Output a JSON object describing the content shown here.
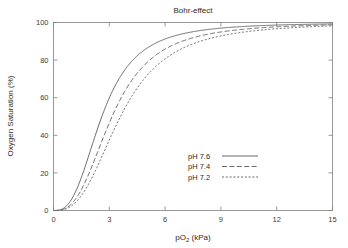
{
  "chart_data": {
    "type": "line",
    "title": "Bohr-effect",
    "xlabel": "pO2 (kPa)",
    "xlabel_base": "pO",
    "xlabel_sub": "2",
    "xlabel_unit": " (kPa)",
    "ylabel": "Oxygen Saturation (%)",
    "xlim": [
      0,
      15
    ],
    "ylim": [
      0,
      100
    ],
    "xticks": [
      0,
      3,
      6,
      9,
      12,
      15
    ],
    "xtick_labels": [
      "0",
      "3",
      "6",
      "9",
      "12",
      "15"
    ],
    "yticks": [
      0,
      20,
      40,
      60,
      80,
      100
    ],
    "ytick_labels": [
      "0",
      "20",
      "40",
      "60",
      "80",
      "100"
    ],
    "grid": false,
    "legend_position": "center-right-inside",
    "x": [
      0,
      0.25,
      0.5,
      0.75,
      1,
      1.25,
      1.5,
      1.75,
      2,
      2.25,
      2.5,
      2.75,
      3,
      3.25,
      3.5,
      3.75,
      4,
      4.5,
      5,
      5.5,
      6,
      6.5,
      7,
      7.5,
      8,
      8.5,
      9,
      9.5,
      10,
      10.5,
      11,
      11.5,
      12,
      12.5,
      13,
      13.5,
      14,
      14.5,
      15
    ],
    "series": [
      {
        "name": "pH 7.6",
        "linestyle": "solid",
        "dasharray": "none",
        "p50": 2.6,
        "hill_n": 2.8,
        "color": "#6a6a6a",
        "values": [
          0,
          0.2,
          1.1,
          3.2,
          6.8,
          12.0,
          18.5,
          25.9,
          33.7,
          41.4,
          48.7,
          55.5,
          61.5,
          66.8,
          71.4,
          75.3,
          78.6,
          83.8,
          87.5,
          90.3,
          92.3,
          93.8,
          95.0,
          95.9,
          96.6,
          97.2,
          97.6,
          98.0,
          98.3,
          98.5,
          98.7,
          98.9,
          99.0,
          99.1,
          99.2,
          99.3,
          99.4,
          99.4,
          99.5
        ]
      },
      {
        "name": "pH 7.4",
        "linestyle": "long-dash",
        "dasharray": "5,2.4",
        "p50": 3.15,
        "hill_n": 2.8,
        "color": "#6a6a6a",
        "values": [
          0,
          0.1,
          0.6,
          1.9,
          4.1,
          7.4,
          11.8,
          17.0,
          22.9,
          29.1,
          35.5,
          41.8,
          47.7,
          53.3,
          58.4,
          63.0,
          67.1,
          73.8,
          79.0,
          83.0,
          86.1,
          88.5,
          90.4,
          91.9,
          93.1,
          94.1,
          94.9,
          95.6,
          96.2,
          96.6,
          97.0,
          97.3,
          97.6,
          97.8,
          98.0,
          98.2,
          98.4,
          98.5,
          98.6
        ]
      },
      {
        "name": "pH 7.2",
        "linestyle": "short-dash",
        "dasharray": "2,1.8",
        "p50": 3.6,
        "hill_n": 2.8,
        "color": "#6a6a6a",
        "values": [
          0,
          0.1,
          0.4,
          1.3,
          2.9,
          5.3,
          8.6,
          12.6,
          17.4,
          22.6,
          28.2,
          33.9,
          39.6,
          45.1,
          50.3,
          55.2,
          59.7,
          67.4,
          73.6,
          78.5,
          82.4,
          85.5,
          88.0,
          90.0,
          91.6,
          92.9,
          94.0,
          94.9,
          95.6,
          96.3,
          96.8,
          97.2,
          97.6,
          97.9,
          98.1,
          98.4,
          98.6,
          98.7,
          98.9
        ]
      }
    ]
  },
  "legend": {
    "entries": [
      {
        "label": "pH 7.6"
      },
      {
        "label": "pH 7.4"
      },
      {
        "label": "pH 7.2"
      }
    ]
  }
}
